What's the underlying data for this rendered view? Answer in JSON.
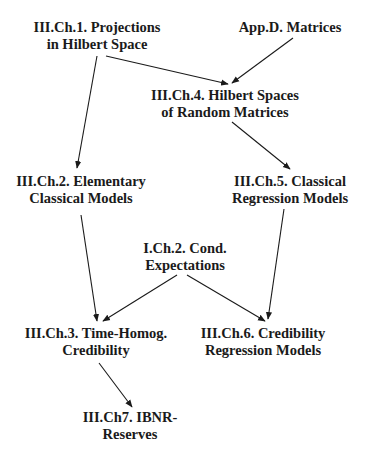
{
  "diagram": {
    "type": "dependency-graph",
    "nodes": {
      "ch1": {
        "line1": "III.Ch.1. Projections",
        "line2": "in Hilbert Space"
      },
      "appd": {
        "line1": "App.D. Matrices"
      },
      "ch4": {
        "line1": "III.Ch.4. Hilbert Spaces",
        "line2": "of Random Matrices"
      },
      "ch2": {
        "line1": "III.Ch.2. Elementary",
        "line2": "Classical Models"
      },
      "ch5": {
        "line1": "III.Ch.5. Classical",
        "line2": "Regression Models"
      },
      "ich2": {
        "line1": "I.Ch.2. Cond.",
        "line2": "Expectations"
      },
      "ch3": {
        "line1": "III.Ch.3. Time-Homog.",
        "line2": "Credibility"
      },
      "ch6": {
        "line1": "III.Ch.6. Credibility",
        "line2": "Regression Models"
      },
      "ch7": {
        "line1": "III.Ch7. IBNR-",
        "line2": "Reserves"
      }
    },
    "edges": [
      {
        "from": "ch1",
        "to": "ch4"
      },
      {
        "from": "appd",
        "to": "ch4"
      },
      {
        "from": "ch1",
        "to": "ch2"
      },
      {
        "from": "ch4",
        "to": "ch5"
      },
      {
        "from": "ch2",
        "to": "ch3"
      },
      {
        "from": "ich2",
        "to": "ch3"
      },
      {
        "from": "ich2",
        "to": "ch6"
      },
      {
        "from": "ch5",
        "to": "ch6"
      },
      {
        "from": "ch3",
        "to": "ch7"
      }
    ],
    "colors": {
      "ink": "#1a1a1a",
      "background": "#ffffff"
    }
  }
}
